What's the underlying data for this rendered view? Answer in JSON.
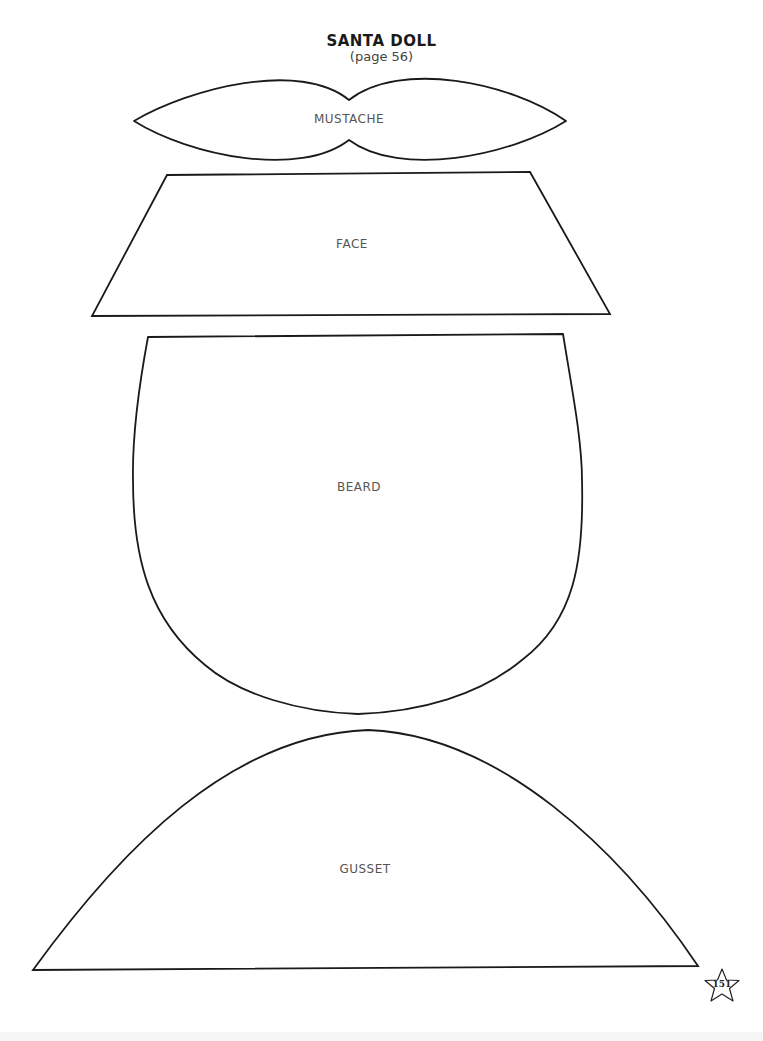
{
  "header": {
    "title": "SANTA DOLL",
    "subtitle": "(page 56)"
  },
  "pattern_pieces": [
    {
      "name": "mustache",
      "label": "MUSTACHE"
    },
    {
      "name": "face",
      "label": "FACE"
    },
    {
      "name": "beard",
      "label": "BEARD"
    },
    {
      "name": "gusset",
      "label": "GUSSET"
    }
  ],
  "footer": {
    "page_number": "151",
    "page_badge_icon": "star-icon"
  },
  "colors": {
    "outline": "#1a1a1a",
    "label_text": "#555555",
    "background": "#ffffff"
  }
}
